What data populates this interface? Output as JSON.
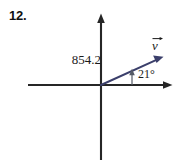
{
  "figure": {
    "problem_number": "12.",
    "background_color": "#ffffff",
    "axis_color": "#262626",
    "vector_color": "#3b3f6b",
    "text_color": "#1a1a1a"
  },
  "labels": {
    "magnitude": "854.2",
    "angle": "21°",
    "vector_name": "v",
    "vector_accent": "vector-arrow-overbar"
  },
  "geometry": {
    "origin": {
      "x": 101,
      "y": 85
    },
    "x_axis": {
      "from_x": 28,
      "to_x": 173,
      "y": 85,
      "arrow_at": "right"
    },
    "y_axis": {
      "x": 101,
      "from_y": 160,
      "to_y": 14,
      "arrow_at": "top"
    },
    "vector": {
      "from_x": 101,
      "from_y": 85,
      "to_x": 163,
      "to_y": 57,
      "angle_degrees": 21
    },
    "angle_indicator": {
      "x": 132,
      "from_y": 85,
      "to_y": 69
    }
  },
  "icons": {
    "x_axis_arrowhead": "arrow-right-icon",
    "y_axis_arrowhead": "arrow-up-icon",
    "vector_arrowhead": "arrow-up-right-icon",
    "angle_arrowhead": "arrow-up-small-icon"
  }
}
